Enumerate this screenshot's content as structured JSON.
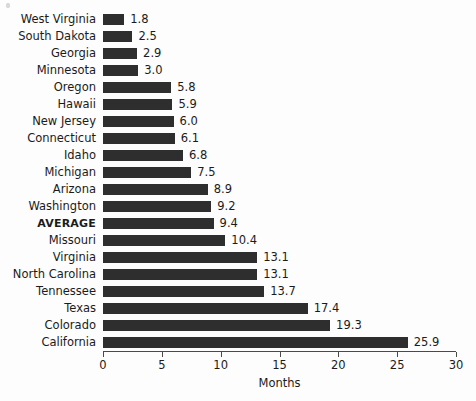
{
  "chart_data": {
    "type": "bar",
    "orientation": "horizontal",
    "title": "",
    "xlabel": "Months",
    "ylabel": "",
    "xlim": [
      0,
      30
    ],
    "xticks": [
      0,
      5,
      10,
      15,
      20,
      25,
      30
    ],
    "xtick_labels": [
      "0",
      "5",
      "10",
      "15",
      "20",
      "25",
      "30"
    ],
    "grid": false,
    "legend": null,
    "bar_color": "#2e2e2e",
    "background_color": "#fdfdfd",
    "emphasis_category": "AVERAGE",
    "categories": [
      "West Virginia",
      "South Dakota",
      "Georgia",
      "Minnesota",
      "Oregon",
      "Hawaii",
      "New Jersey",
      "Connecticut",
      "Idaho",
      "Michigan",
      "Arizona",
      "Washington",
      "AVERAGE",
      "Missouri",
      "Virginia",
      "North Carolina",
      "Tennessee",
      "Texas",
      "Colorado",
      "California"
    ],
    "values": [
      1.8,
      2.5,
      2.9,
      3.0,
      5.8,
      5.9,
      6.0,
      6.1,
      6.8,
      7.5,
      8.9,
      9.2,
      9.4,
      10.4,
      13.1,
      13.1,
      13.7,
      17.4,
      19.3,
      25.9
    ],
    "value_labels": [
      "1.8",
      "2.5",
      "2.9",
      "3.0",
      "5.8",
      "5.9",
      "6.0",
      "6.1",
      "6.8",
      "7.5",
      "8.9",
      "9.2",
      "9.4",
      "10.4",
      "13.1",
      "13.1",
      "13.7",
      "17.4",
      "19.3",
      "25.9"
    ]
  }
}
